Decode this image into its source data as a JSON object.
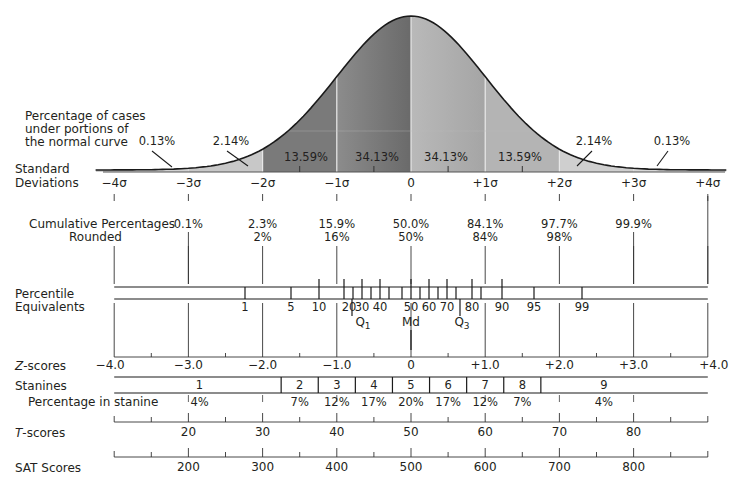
{
  "title_note": [
    "Percentage of cases",
    "under portions of",
    "the normal curve"
  ],
  "row_labels": {
    "std_dev": [
      "Standard",
      "Deviations"
    ],
    "cumulative": [
      "Cumulative Percentages",
      "Rounded"
    ],
    "percentile": [
      "Percentile",
      "Equivalents"
    ],
    "zscores_prefix": "Z",
    "zscores_suffix": "-scores",
    "stanines": "Stanines",
    "pct_in_stanine": "Percentage in stanine",
    "tscores_prefix": "T",
    "tscores_suffix": "-scores",
    "sat": "SAT Scores"
  },
  "chart_data": {
    "type": "area",
    "sigma_labels": [
      "−4σ",
      "−3σ",
      "−2σ",
      "−1σ",
      "0",
      "+1σ",
      "+2σ",
      "+3σ",
      "+4σ"
    ],
    "region_percentages": [
      {
        "from": -4,
        "to": -3,
        "label": "0.13%"
      },
      {
        "from": -3,
        "to": -2,
        "label": "2.14%"
      },
      {
        "from": -2,
        "to": -1,
        "label": "13.59%"
      },
      {
        "from": -1,
        "to": 0,
        "label": "34.13%"
      },
      {
        "from": 0,
        "to": 1,
        "label": "34.13%"
      },
      {
        "from": 1,
        "to": 2,
        "label": "13.59%"
      },
      {
        "from": 2,
        "to": 3,
        "label": "2.14%"
      },
      {
        "from": 3,
        "to": 4,
        "label": "0.13%"
      }
    ],
    "cumulative_percentages": [
      {
        "sigma": -3,
        "exact": "0.1%",
        "rounded": ""
      },
      {
        "sigma": -2,
        "exact": "2.3%",
        "rounded": "2%"
      },
      {
        "sigma": -1,
        "exact": "15.9%",
        "rounded": "16%"
      },
      {
        "sigma": 0,
        "exact": "50.0%",
        "rounded": "50%"
      },
      {
        "sigma": 1,
        "exact": "84.1%",
        "rounded": "84%"
      },
      {
        "sigma": 2,
        "exact": "97.7%",
        "rounded": "98%"
      },
      {
        "sigma": 3,
        "exact": "99.9%",
        "rounded": ""
      }
    ],
    "percentile_equivalents": [
      "1",
      "5",
      "10",
      "20",
      "30",
      "40",
      "50",
      "60",
      "70",
      "80",
      "90",
      "95",
      "99"
    ],
    "quartile_labels": {
      "q1": "Q",
      "q1_sub": "1",
      "md": "Md",
      "q3": "Q",
      "q3_sub": "3"
    },
    "z_scores": [
      "−4.0",
      "−3.0",
      "−2.0",
      "−1.0",
      "0",
      "+1.0",
      "+2.0",
      "+3.0",
      "+4.0"
    ],
    "stanines": [
      "1",
      "2",
      "3",
      "4",
      "5",
      "6",
      "7",
      "8",
      "9"
    ],
    "stanine_percentages": [
      "4%",
      "7%",
      "12%",
      "17%",
      "20%",
      "17%",
      "12%",
      "7%",
      "4%"
    ],
    "t_scores": [
      "20",
      "30",
      "40",
      "50",
      "60",
      "70",
      "80"
    ],
    "sat_scores": [
      "200",
      "300",
      "400",
      "500",
      "600",
      "700",
      "800"
    ]
  }
}
